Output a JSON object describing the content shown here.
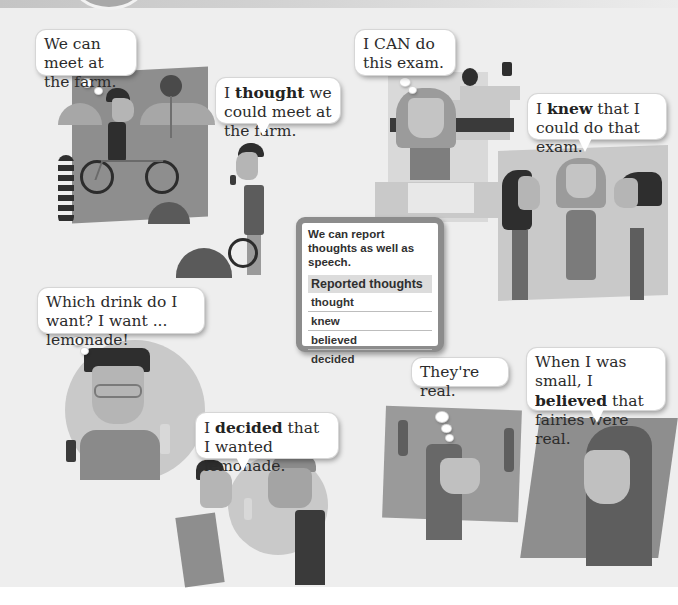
{
  "page": {
    "background": "#eeeeee",
    "accent": "#8c8c8c"
  },
  "scenes": {
    "farm": {
      "thought_bubble": "We can meet at the farm.",
      "speech_bubble": {
        "prefix": "I ",
        "bold": "thought",
        "suffix": " we could meet at the farm."
      }
    },
    "exam": {
      "thought_bubble": "I CAN do this exam.",
      "speech_bubble": {
        "prefix": "I ",
        "bold": "knew",
        "suffix": " that I could do that exam."
      }
    },
    "drink": {
      "thought_bubble": "Which drink do I want? I want ... lemonade!",
      "speech_bubble": {
        "prefix": "I ",
        "bold": "decided",
        "suffix": " that I wanted lemonade."
      }
    },
    "fairies": {
      "thought_bubble": "They're real.",
      "speech_bubble": {
        "prefix": "When I was small, I ",
        "bold": "believed",
        "suffix": " that fairies were real."
      }
    }
  },
  "grammar_box": {
    "intro": "We can report thoughts as well as speech.",
    "table_header": "Reported thoughts",
    "rows": [
      "thought",
      "knew",
      "believed",
      "decided"
    ]
  }
}
